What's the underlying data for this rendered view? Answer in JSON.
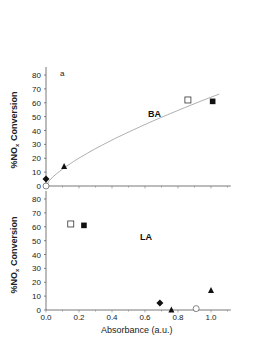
{
  "chart_data": [
    {
      "type": "scatter",
      "panel_label": "a",
      "title": "BA",
      "xlabel": "Absorbance (a.u.)",
      "ylabel": "%NOx Conversion",
      "ylim": [
        0,
        80
      ],
      "xlim": [
        0.0,
        1.1
      ],
      "yticks": [
        0,
        10,
        20,
        30,
        40,
        50,
        60,
        70,
        80
      ],
      "fit_curve": "monotonic increasing fit through origin",
      "points": [
        {
          "x": 0.0,
          "y": 5,
          "marker": "diamond-filled"
        },
        {
          "x": 0.0,
          "y": 0,
          "marker": "circle-open"
        },
        {
          "x": 0.11,
          "y": 14,
          "marker": "triangle-filled"
        },
        {
          "x": 0.86,
          "y": 62,
          "marker": "square-open"
        },
        {
          "x": 1.01,
          "y": 61,
          "marker": "square-filled"
        }
      ]
    },
    {
      "type": "scatter",
      "title": "LA",
      "xlabel": "Absorbance (a.u.)",
      "ylabel": "%NOx Conversion",
      "ylim": [
        0,
        80
      ],
      "xlim": [
        0.0,
        1.1
      ],
      "xticks": [
        "0.0",
        "0.2",
        "0.4",
        "0.6",
        "0.8",
        "1.0"
      ],
      "yticks": [
        0,
        10,
        20,
        30,
        40,
        50,
        60,
        70,
        80
      ],
      "points": [
        {
          "x": 0.15,
          "y": 62,
          "marker": "square-open"
        },
        {
          "x": 0.23,
          "y": 61,
          "marker": "square-filled"
        },
        {
          "x": 0.69,
          "y": 5,
          "marker": "diamond-filled"
        },
        {
          "x": 0.76,
          "y": 0,
          "marker": "triangle-filled"
        },
        {
          "x": 0.91,
          "y": 1,
          "marker": "circle-open"
        },
        {
          "x": 1.0,
          "y": 14,
          "marker": "triangle-filled"
        }
      ]
    }
  ],
  "labels": {
    "top_panel_label": "a",
    "top_title": "BA",
    "bottom_title": "LA",
    "ylabel_main": "%NO",
    "ylabel_sub": "x",
    "ylabel_rest": " Conversion",
    "xlabel": "Absorbance (a.u.)"
  }
}
